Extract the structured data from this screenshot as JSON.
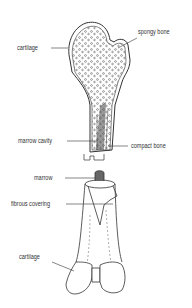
{
  "figure": {
    "top_bone": {
      "labels": {
        "cartilage": "cartilage",
        "spongy_bone": "spongy bone",
        "marrow_cavity": "marrow cavity",
        "compact_bone": "compact bone"
      }
    },
    "bottom_bone": {
      "labels": {
        "marrow": "marrow",
        "fibrous_covering": "fibrous covering",
        "cartilage": "cartilage"
      }
    },
    "colors": {
      "line": "#333333",
      "background": "#ffffff"
    }
  }
}
